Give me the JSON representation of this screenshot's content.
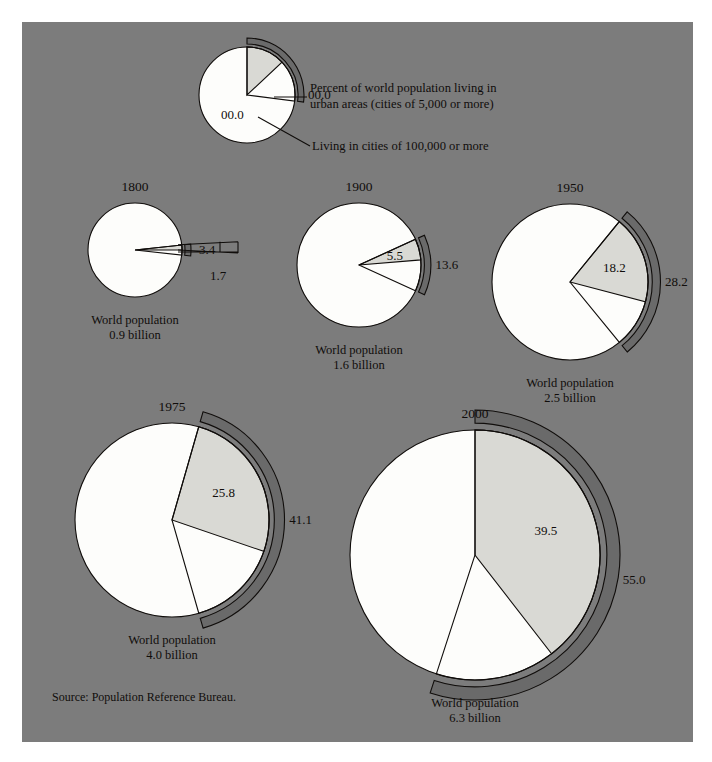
{
  "figure": {
    "background_color": "#7c7c7c",
    "page_color": "#ffffff",
    "wedge_color": "#d9d9d4",
    "body_color": "#fdfdfb",
    "band_color": "#6a6a6a",
    "ink_color": "#100d0b"
  },
  "legend": {
    "key_urban_value": "00.0",
    "key_city_value": "00.0",
    "urban_line1": "Percent of world population living in",
    "urban_line2": "urban areas (cities of 5,000 or more)",
    "city_line": "Living in cities of 100,000 or more"
  },
  "source": "Source: Population Reference Bureau.",
  "population_caption": "World population",
  "chart_data": {
    "type": "pie",
    "title": "",
    "subtitle": "",
    "legend_position": "top",
    "series": [
      {
        "name": "Percent of world population living in urban areas (cities of 5,000 or more)",
        "values": [
          3.4,
          13.6,
          28.2,
          41.1,
          55.0
        ]
      },
      {
        "name": "Living in cities of 100,000 or more",
        "values": [
          1.7,
          5.5,
          18.2,
          25.8,
          39.5
        ]
      }
    ],
    "categories": [
      "1800",
      "1900",
      "1950",
      "1975",
      "2000"
    ],
    "world_population_billions": [
      0.9,
      1.6,
      2.5,
      4.0,
      6.3
    ],
    "xlabel": "Year",
    "ylabel": "Percent",
    "grid": false
  },
  "pies": [
    {
      "id": "legend-key",
      "year": "",
      "population_text": "",
      "urban_value": "00.0",
      "city_value": "00.0",
      "urban_pct": 27.0,
      "city_pct": 13.0,
      "cx": 225,
      "cy": 73,
      "r": 48,
      "start_angle_deg": -90
    },
    {
      "id": "pie-1800",
      "year": "1800",
      "population_text": "0.9 billion",
      "urban_value": "3.4",
      "city_value": "1.7",
      "urban_pct": 3.4,
      "city_pct": 1.7,
      "cx": 113,
      "cy": 228,
      "r": 47,
      "start_angle_deg": -6.1
    },
    {
      "id": "pie-1900",
      "year": "1900",
      "population_text": "1.6 billion",
      "urban_value": "13.6",
      "city_value": "5.5",
      "urban_pct": 13.6,
      "city_pct": 5.5,
      "cx": 337,
      "cy": 243,
      "r": 62,
      "start_angle_deg": -24.5
    },
    {
      "id": "pie-1950",
      "year": "1950",
      "population_text": "2.5 billion",
      "urban_value": "28.2",
      "city_value": "18.2",
      "urban_pct": 28.2,
      "city_pct": 18.2,
      "cx": 548,
      "cy": 260,
      "r": 78,
      "start_angle_deg": -50.8
    },
    {
      "id": "pie-1975",
      "year": "1975",
      "population_text": "4.0 billion",
      "urban_value": "41.1",
      "city_value": "25.8",
      "urban_pct": 41.1,
      "city_pct": 25.8,
      "cx": 150,
      "cy": 498,
      "r": 97,
      "start_angle_deg": -74.0
    },
    {
      "id": "pie-2000",
      "year": "2000",
      "population_text": "6.3 billion",
      "urban_value": "55.0",
      "city_value": "39.5",
      "urban_pct": 55.0,
      "city_pct": 39.5,
      "cx": 453,
      "cy": 533,
      "r": 125,
      "start_angle_deg": -90.0
    }
  ]
}
